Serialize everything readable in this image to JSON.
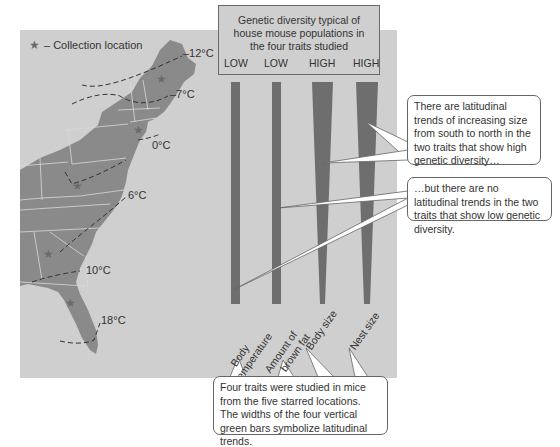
{
  "legend": {
    "icon": "star-icon",
    "symbol": "★",
    "label": "– Collection location"
  },
  "isotherms": [
    {
      "label": "–12°C"
    },
    {
      "label": "–7°C"
    },
    {
      "label": "0°C"
    },
    {
      "label": "6°C"
    },
    {
      "label": "10°C"
    },
    {
      "label": "18°C"
    }
  ],
  "top_box": {
    "title_lines": [
      "Genetic diversity typical of",
      "house mouse populations in",
      "the four traits studied"
    ],
    "levels": [
      "LOW",
      "LOW",
      "HIGH",
      "HIGH"
    ]
  },
  "traits": [
    {
      "label_lines": [
        "Body",
        "temperature"
      ],
      "diversity": "LOW",
      "shape": "uniform"
    },
    {
      "label_lines": [
        "Amount of",
        "brown fat"
      ],
      "diversity": "LOW",
      "shape": "uniform"
    },
    {
      "label_lines": [
        "Body size"
      ],
      "diversity": "HIGH",
      "shape": "tapered"
    },
    {
      "label_lines": [
        "Nest size"
      ],
      "diversity": "HIGH",
      "shape": "tapered"
    }
  ],
  "callouts": {
    "high": "There are latitudinal trends of increasing size from south to north in the two traits that show high genetic diversity…",
    "low": "…but there are no latitudinal trends in the two traits that show low genetic diversity.",
    "bottom": "Four traits were studied in mice from the five starred locations. The widths of the four vertical green bars symbolize latitudinal trends."
  },
  "colors": {
    "panel": "#cfcfcf",
    "land": "#8a8a8a",
    "bar": "#6e6e6e",
    "star": "#6b6b6b",
    "callout_bg": "#ffffff"
  }
}
